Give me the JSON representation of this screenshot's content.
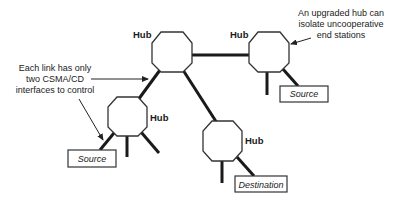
{
  "hubs": [
    {
      "id": "center",
      "label": "Hub"
    },
    {
      "id": "right",
      "label": "Hub"
    },
    {
      "id": "left",
      "label": "Hub"
    },
    {
      "id": "bottom",
      "label": "Hub"
    }
  ],
  "stations": {
    "left_source": "Source",
    "right_source": "Source",
    "destination": "Destination"
  },
  "annotations": {
    "left": [
      "Each link has only",
      "two CSMA/CD",
      "interfaces to control"
    ],
    "right": [
      "An upgraded hub can",
      "isolate uncooperative",
      "end stations"
    ]
  },
  "colors": {
    "line": "#1a1a1a",
    "background": "#ffffff"
  }
}
